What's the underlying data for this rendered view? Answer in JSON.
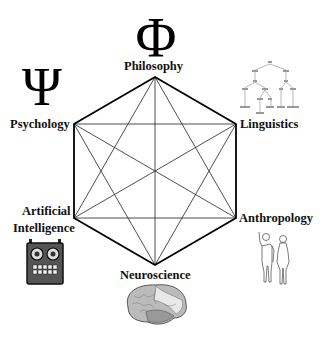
{
  "diagram": {
    "type": "hexagram-in-hexagon",
    "nodes": [
      {
        "id": "philosophy",
        "label": "Philosophy",
        "icon": "phi-symbol-icon",
        "glyph": "Φ"
      },
      {
        "id": "linguistics",
        "label": "Linguistics",
        "icon": "syntax-tree-icon"
      },
      {
        "id": "anthropology",
        "label": "Anthropology",
        "icon": "human-figures-icon"
      },
      {
        "id": "neuroscience",
        "label": "Neuroscience",
        "icon": "brain-icon"
      },
      {
        "id": "ai",
        "label_line1": "Artificial",
        "label_line2": "Intelligence",
        "icon": "robot-icon"
      },
      {
        "id": "psychology",
        "label": "Psychology",
        "icon": "psi-symbol-icon",
        "glyph": "Ψ"
      }
    ],
    "edges": "all pairs connected (complete graph K6)",
    "colors": {
      "outer": "#000000",
      "inner": "#333333",
      "background": "#ffffff"
    }
  }
}
